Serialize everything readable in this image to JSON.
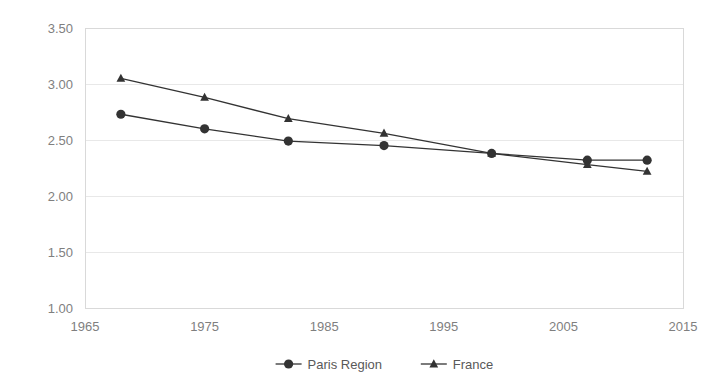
{
  "chart_data": {
    "type": "line",
    "title": "",
    "subtitle": "",
    "xlabel": "",
    "ylabel": "",
    "xlim": [
      1965,
      2015
    ],
    "ylim": [
      1.0,
      3.5
    ],
    "ytick_step": 0.5,
    "xtick_step": 10,
    "grid": true,
    "grid_axis": "y",
    "legend_position": "bottom",
    "yticks": [
      "1.00",
      "1.50",
      "2.00",
      "2.50",
      "3.00",
      "3.50"
    ],
    "ytick_values": [
      1.0,
      1.5,
      2.0,
      2.5,
      3.0,
      3.5
    ],
    "xticks": [
      "1965",
      "1975",
      "1985",
      "1995",
      "2005",
      "2015"
    ],
    "xtick_values": [
      1965,
      1975,
      1985,
      1995,
      2005,
      2015
    ],
    "x": [
      1968,
      1975,
      1982,
      1990,
      1999,
      2007,
      2012
    ],
    "series": [
      {
        "name": "Paris Region",
        "marker": "circle",
        "color": "#333333",
        "values": [
          2.73,
          2.6,
          2.49,
          2.45,
          2.38,
          2.32,
          2.32
        ]
      },
      {
        "name": "France",
        "marker": "triangle",
        "color": "#333333",
        "values": [
          3.05,
          2.88,
          2.69,
          2.56,
          2.38,
          2.28,
          2.22
        ]
      }
    ]
  },
  "legend": {
    "entries": [
      {
        "label": "Paris Region",
        "marker": "circle"
      },
      {
        "label": "France",
        "marker": "triangle"
      }
    ]
  },
  "colors": {
    "series": "#333333",
    "gridline": "#e8e8e8",
    "axis_text": "#7f7f7f",
    "legend_text": "#595959",
    "background": "#ffffff",
    "plot_border": "#d9d9d9"
  }
}
